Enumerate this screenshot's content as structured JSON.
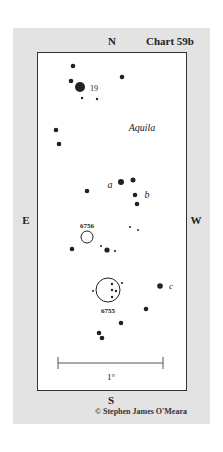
{
  "chart": {
    "title": "Chart 59b",
    "directions": {
      "north": "N",
      "south": "S",
      "east": "E",
      "west": "W"
    },
    "constellation": "Aquila",
    "copyright": "© Stephen James O'Meara",
    "scale": {
      "label": "1°"
    },
    "star_labels": {
      "nineteen": "19",
      "a": "a",
      "b": "b",
      "c": "c"
    },
    "objects": {
      "ngc6756": "6756",
      "ngc6755": "6755"
    }
  }
}
